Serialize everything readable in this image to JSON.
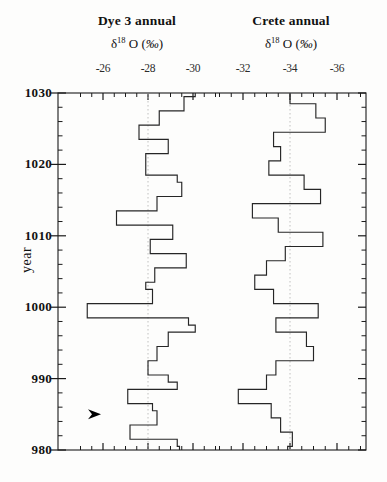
{
  "figure": {
    "yaxis_label": "year",
    "y_ticks": [
      1030,
      1020,
      1010,
      1000,
      990,
      980
    ],
    "marker_note": "➤"
  },
  "panels": {
    "dye3": {
      "title": "Dye 3 annual",
      "subtitle_delta": "δ",
      "subtitle_sup": "18",
      "subtitle_rest": " O (",
      "subtitle_permil": "‰",
      "subtitle_close": ")",
      "x_ticks": [
        -26,
        -28,
        -30
      ],
      "reference_value": -28
    },
    "crete": {
      "title": "Crete annual",
      "subtitle_delta": "δ",
      "subtitle_sup": "18",
      "subtitle_rest": " O (",
      "subtitle_permil": "‰",
      "subtitle_close": ")",
      "x_ticks": [
        -32,
        -34,
        -36
      ],
      "reference_value": -34
    }
  },
  "chart_data": {
    "type": "line",
    "xlabel": "δ18 O (‰)",
    "ylabel": "year",
    "ylim": [
      980,
      1030
    ],
    "orientation": "horizontal-value-vertical-year",
    "step_style": "step-post (annual bins)",
    "grid": false,
    "legend": "none",
    "annotations": [
      {
        "text": "arrow marker",
        "year": 985,
        "panel": "dye3",
        "symbol": "➤"
      }
    ],
    "series": [
      {
        "name": "Dye 3 annual δ18O (‰)",
        "xlim": [
          -25.0,
          -31.0
        ],
        "x_ticks": [
          -26,
          -28,
          -30
        ],
        "reference_line": -28,
        "years": [
          1030,
          1029,
          1028,
          1027,
          1026,
          1025,
          1024,
          1023,
          1022,
          1021,
          1020,
          1019,
          1018,
          1017,
          1016,
          1015,
          1014,
          1013,
          1012,
          1011,
          1010,
          1009,
          1008,
          1007,
          1006,
          1005,
          1004,
          1003,
          1002,
          1001,
          1000,
          999,
          998,
          997,
          996,
          995,
          994,
          993,
          992,
          991,
          990,
          989,
          988,
          987,
          986,
          985,
          984,
          983,
          982,
          981,
          980
        ],
        "values": [
          -30.1,
          -29.6,
          -29.6,
          -28.5,
          -28.5,
          -27.6,
          -27.6,
          -28.9,
          -28.9,
          -27.9,
          -27.9,
          -27.9,
          -29.3,
          -29.5,
          -29.5,
          -28.4,
          -28.4,
          -26.6,
          -26.6,
          -29.1,
          -29.1,
          -28.1,
          -28.1,
          -29.7,
          -29.7,
          -28.3,
          -28.3,
          -27.9,
          -28.2,
          -28.2,
          -25.3,
          -25.3,
          -29.8,
          -30.1,
          -28.9,
          -28.9,
          -28.4,
          -28.4,
          -28.0,
          -28.0,
          -28.9,
          -29.3,
          -27.1,
          -27.1,
          -28.2,
          -28.4,
          -28.4,
          -27.2,
          -27.2,
          -29.3,
          -29.4
        ]
      },
      {
        "name": "Crete annual δ18O (‰)",
        "xlim": [
          -31.0,
          -37.0
        ],
        "x_ticks": [
          -32,
          -34,
          -36
        ],
        "reference_line": -34,
        "years": [
          1030,
          1029,
          1028,
          1027,
          1026,
          1025,
          1024,
          1023,
          1022,
          1021,
          1020,
          1019,
          1018,
          1017,
          1016,
          1015,
          1014,
          1013,
          1012,
          1011,
          1010,
          1009,
          1008,
          1007,
          1006,
          1005,
          1004,
          1003,
          1002,
          1001,
          1000,
          999,
          998,
          997,
          996,
          995,
          994,
          993,
          992,
          991,
          990,
          989,
          988,
          987,
          986,
          985,
          984,
          983,
          982,
          981,
          980
        ],
        "values": [
          -34.0,
          -34.0,
          -35.1,
          -35.1,
          -35.5,
          -35.5,
          -33.3,
          -33.3,
          -33.6,
          -33.6,
          -33.1,
          -33.1,
          -34.6,
          -34.6,
          -35.3,
          -35.3,
          -32.4,
          -32.4,
          -33.5,
          -33.5,
          -35.4,
          -35.4,
          -33.8,
          -33.8,
          -33.0,
          -33.0,
          -32.5,
          -32.5,
          -33.3,
          -33.3,
          -35.2,
          -35.2,
          -33.4,
          -33.4,
          -34.7,
          -34.7,
          -35.0,
          -35.0,
          -33.4,
          -33.4,
          -33.0,
          -33.0,
          -31.8,
          -31.8,
          -33.2,
          -33.2,
          -33.6,
          -33.6,
          -34.1,
          -34.1,
          -33.9
        ]
      }
    ]
  }
}
